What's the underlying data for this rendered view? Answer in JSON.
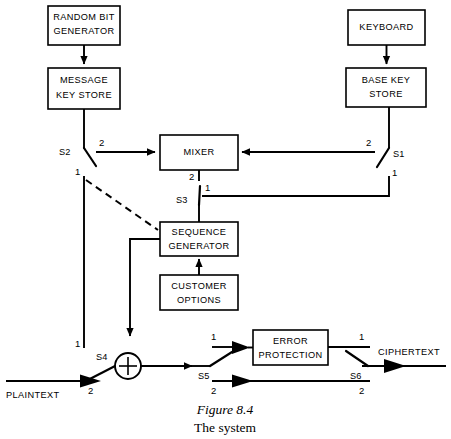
{
  "figure": {
    "caption_line1": "Figure 8.4",
    "caption_line2": "The system"
  },
  "blocks": {
    "random_bit_generator": {
      "line1": "RANDOM  BIT",
      "line2": "GENERATOR"
    },
    "message_key_store": {
      "line1": "MESSAGE",
      "line2": "KEY STORE"
    },
    "keyboard": {
      "line1": "KEYBOARD"
    },
    "base_key_store": {
      "line1": "BASE  KEY",
      "line2": "STORE"
    },
    "mixer": {
      "line1": "MIXER"
    },
    "sequence_generator": {
      "line1": "SEQUENCE",
      "line2": "GENERATOR"
    },
    "customer_options": {
      "line1": "CUSTOMER",
      "line2": "OPTIONS"
    },
    "error_protection": {
      "line1": "ERROR",
      "line2": "PROTECTION"
    }
  },
  "signals": {
    "plaintext": "PLAINTEXT",
    "ciphertext": "CIPHERTEXT"
  },
  "switches": {
    "s1": {
      "name": "S1",
      "pos_a": "2",
      "pos_b": "1"
    },
    "s2": {
      "name": "S2",
      "pos_a": "2",
      "pos_b": "1"
    },
    "s3": {
      "name": "S3",
      "pos_a": "2",
      "pos_b": "1"
    },
    "s4": {
      "name": "S4",
      "pos_a": "1",
      "pos_b": "2"
    },
    "s5": {
      "name": "S5",
      "pos_a": "1",
      "pos_b": "2"
    },
    "s6": {
      "name": "S6",
      "pos_a": "1",
      "pos_b": "2"
    }
  },
  "symbols": {
    "xor": "+"
  },
  "colors": {
    "ink": "#000000",
    "paper": "#ffffff"
  }
}
